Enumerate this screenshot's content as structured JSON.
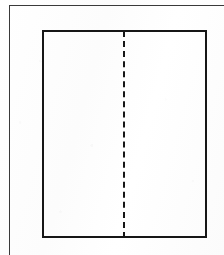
{
  "figure": {
    "title": "",
    "background_color": "#fdfdfd",
    "ink_color": "#161616",
    "frame_color": "#3a3a3a",
    "width": 224,
    "height": 255
  },
  "outer_frame": {
    "name": "page-border",
    "style": "solid",
    "thickness_px": 1,
    "color": "#3a3a3a",
    "top_y": 5,
    "left_x": 9,
    "label": ""
  },
  "rectangle": {
    "name": "main-rectangle",
    "style": "solid",
    "thickness_px": 2,
    "color": "#161616",
    "x": 42,
    "y": 30,
    "width": 165,
    "height": 208,
    "fill": "none",
    "label": ""
  },
  "center_axis": {
    "name": "vertical-dashed-centerline",
    "style": "dashed",
    "thickness_px": 2,
    "color": "#161616",
    "orientation": "vertical",
    "x": 124,
    "y_start": 31,
    "y_end": 238,
    "dash_length_px": 6,
    "gap_length_px": 4,
    "label": ""
  },
  "chart_data": {
    "type": "diagram",
    "title": "",
    "shapes": [
      {
        "kind": "rectangle",
        "name": "main-rectangle",
        "stroke": "#161616",
        "stroke_width": 2,
        "dash": "solid",
        "fill": "none",
        "x": 42,
        "y": 30,
        "width": 165,
        "height": 208
      },
      {
        "kind": "line",
        "name": "vertical-dashed-centerline",
        "stroke": "#161616",
        "stroke_width": 2,
        "dash": "6,4",
        "x1": 124,
        "y1": 31,
        "x2": 124,
        "y2": 238
      },
      {
        "kind": "line",
        "name": "page-border-top",
        "stroke": "#3a3a3a",
        "stroke_width": 1,
        "dash": "solid",
        "x1": 9,
        "y1": 5,
        "x2": 224,
        "y2": 5
      },
      {
        "kind": "line",
        "name": "page-border-left",
        "stroke": "#3a3a3a",
        "stroke_width": 1,
        "dash": "solid",
        "x1": 9,
        "y1": 5,
        "x2": 9,
        "y2": 255
      }
    ],
    "annotations": [],
    "legend": [],
    "axis_labels": []
  }
}
